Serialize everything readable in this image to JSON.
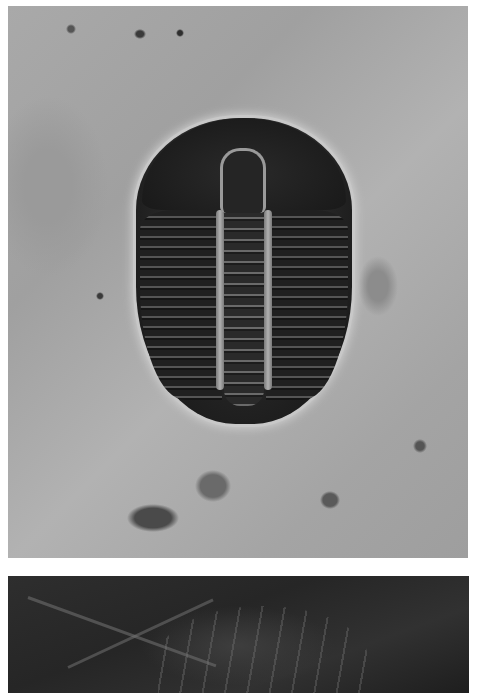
{
  "figure": {
    "panels": [
      {
        "id": "top",
        "subject": "trilobite fossil (dorsal view) on grey rock matrix"
      },
      {
        "id": "bottom",
        "subject": "trilobite fossil impression on dark shale"
      }
    ]
  }
}
